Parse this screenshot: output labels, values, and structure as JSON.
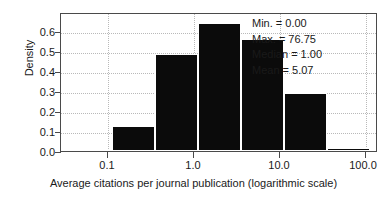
{
  "chart_data": {
    "type": "bar",
    "title": "",
    "subtitle": "",
    "xlabel": "Average citations per journal publication (logarithmic scale)",
    "ylabel": "Density",
    "xscale": "log",
    "grid": true,
    "legend_position": "none",
    "xlim": [
      0.0316,
      316.23
    ],
    "ylim": [
      0.0,
      0.65
    ],
    "x_tick_labels": [
      "0.1",
      "1.0",
      "10.0",
      "100.0"
    ],
    "x_tick_values": [
      0.1,
      1.0,
      10.0,
      100.0
    ],
    "y_tick_labels": [
      "0.0",
      "0.1",
      "0.2",
      "0.3",
      "0.4",
      "0.5",
      "0.6"
    ],
    "y_tick_values": [
      0.0,
      0.1,
      0.2,
      0.3,
      0.4,
      0.5,
      0.6
    ],
    "bin_edges_log10": [
      -1.5,
      -1.0,
      -0.5,
      0.0,
      0.5,
      1.0,
      1.5,
      2.0,
      2.5
    ],
    "categories": [
      "0.0316-0.1",
      "0.1-0.316",
      "0.316-1.0",
      "1.0-3.16",
      "3.16-10.0",
      "10.0-31.6",
      "31.6-100.0"
    ],
    "values": [
      0.01,
      0.12,
      0.46,
      0.605,
      0.53,
      0.275,
      0.015
    ],
    "bar_color": "#0b0b0b",
    "annotations": [
      "Min. = 0.00",
      "Max. = 76.75",
      "Median = 1.00",
      "Mean = 5.07"
    ],
    "statistics": {
      "min_label": "Min. = 0.00",
      "max_label": "Max. = 76.75",
      "median_label": "Median = 1.00",
      "mean_label": "Mean = 5.07",
      "min": 0.0,
      "max": 76.75,
      "median": 1.0,
      "mean": 5.07
    }
  },
  "colors": {
    "bar": "#0b0b0b",
    "axis": "#4a4a4a",
    "grid": "#b9b9b9",
    "text": "#1a1a1a",
    "background": "#ffffff"
  }
}
